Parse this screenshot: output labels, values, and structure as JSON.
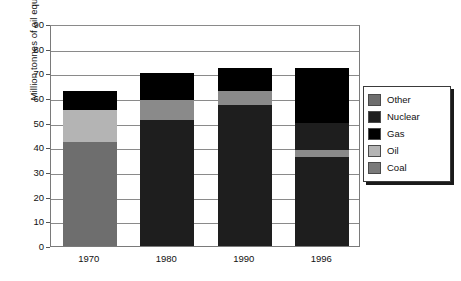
{
  "chart_data": {
    "type": "bar",
    "subtype": "stacked",
    "title": "",
    "xlabel": "",
    "ylabel": "Million tonnes of oil equivalent",
    "categories": [
      "1970",
      "1980",
      "1990",
      "1996"
    ],
    "ylim": [
      0,
      90
    ],
    "ytick_step": 10,
    "yticks": [
      "90",
      "80",
      "70",
      "60",
      "50",
      "40",
      "30",
      "20",
      "10",
      "0"
    ],
    "grid": true,
    "legend_position": "right",
    "series": [
      {
        "name": "Coal",
        "color": "#6e6e6e",
        "values": [
          42,
          0,
          0,
          0
        ]
      },
      {
        "name": "Oil",
        "color": "#b4b4b4",
        "values": [
          13,
          8,
          6,
          3
        ]
      },
      {
        "name": "Gas",
        "color": "#000000",
        "values": [
          8,
          11,
          9,
          22
        ]
      },
      {
        "name": "Nuclear",
        "color": "#1e1e1e",
        "values": [
          0,
          51,
          57,
          47
        ]
      },
      {
        "name": "Other",
        "color": "#6e6e6e",
        "values": [
          0,
          0,
          0,
          0
        ]
      }
    ],
    "totals": [
      63,
      70,
      72,
      72
    ],
    "stack_order_bottom_to_top": [
      "Coal",
      "Nuclear",
      "Oil",
      "Gas"
    ],
    "bars": [
      {
        "category": "1970",
        "total": 63,
        "segments": [
          {
            "name": "Coal",
            "from": 0,
            "to": 42,
            "color": "#6e6e6e"
          },
          {
            "name": "Oil",
            "from": 42,
            "to": 55,
            "color": "#b4b4b4"
          },
          {
            "name": "Gas",
            "from": 55,
            "to": 63,
            "color": "#000000"
          }
        ]
      },
      {
        "category": "1980",
        "total": 70,
        "segments": [
          {
            "name": "Nuclear",
            "from": 0,
            "to": 51,
            "color": "#1e1e1e"
          },
          {
            "name": "Oil",
            "from": 51,
            "to": 59,
            "color": "#8a8a8a"
          },
          {
            "name": "Gas",
            "from": 59,
            "to": 70,
            "color": "#000000"
          }
        ]
      },
      {
        "category": "1990",
        "total": 72,
        "segments": [
          {
            "name": "Nuclear",
            "from": 0,
            "to": 57,
            "color": "#1e1e1e"
          },
          {
            "name": "Oil",
            "from": 57,
            "to": 63,
            "color": "#8a8a8a"
          },
          {
            "name": "Gas",
            "from": 63,
            "to": 72,
            "color": "#000000"
          }
        ]
      },
      {
        "category": "1996",
        "total": 72,
        "segments": [
          {
            "name": "Nuclear",
            "from": 0,
            "to": 36,
            "color": "#1e1e1e"
          },
          {
            "name": "Oil",
            "from": 36,
            "to": 39,
            "color": "#8a8a8a"
          },
          {
            "name": "Nuclear2",
            "from": 39,
            "to": 50,
            "color": "#1e1e1e"
          },
          {
            "name": "Gas",
            "from": 50,
            "to": 72,
            "color": "#000000"
          }
        ]
      }
    ],
    "legend": [
      {
        "label": "Other",
        "color": "#6e6e6e"
      },
      {
        "label": "Nuclear",
        "color": "#1e1e1e"
      },
      {
        "label": "Gas",
        "color": "#000000"
      },
      {
        "label": "Oil",
        "color": "#b4b4b4"
      },
      {
        "label": "Coal",
        "color": "#7a7a7a"
      }
    ]
  }
}
